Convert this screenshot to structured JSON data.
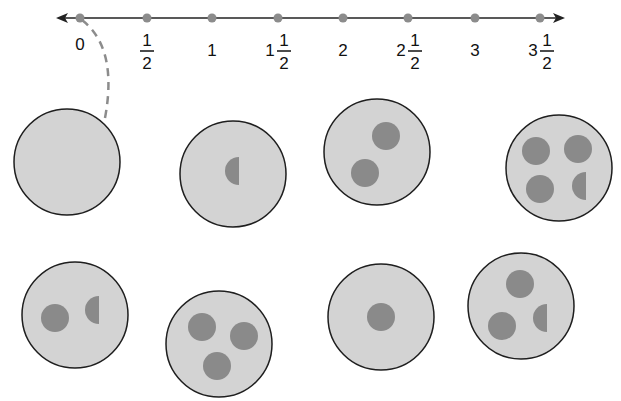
{
  "number_line": {
    "labels": [
      {
        "whole": "0",
        "num": "",
        "den": ""
      },
      {
        "whole": "",
        "num": "1",
        "den": "2"
      },
      {
        "whole": "1",
        "num": "",
        "den": ""
      },
      {
        "whole": "1",
        "num": "1",
        "den": "2"
      },
      {
        "whole": "2",
        "num": "",
        "den": ""
      },
      {
        "whole": "2",
        "num": "1",
        "den": "2"
      },
      {
        "whole": "3",
        "num": "",
        "den": ""
      },
      {
        "whole": "3",
        "num": "1",
        "den": "2"
      }
    ],
    "values": [
      0,
      0.5,
      1,
      1.5,
      2,
      2.5,
      3,
      3.5
    ]
  },
  "circles": [
    {
      "id": "circle-1",
      "row": 1,
      "whole_dots": 0,
      "half_dots": 0,
      "value": 0
    },
    {
      "id": "circle-2",
      "row": 1,
      "whole_dots": 0,
      "half_dots": 1,
      "value": 0.5
    },
    {
      "id": "circle-3",
      "row": 1,
      "whole_dots": 2,
      "half_dots": 0,
      "value": 2
    },
    {
      "id": "circle-4",
      "row": 1,
      "whole_dots": 3,
      "half_dots": 1,
      "value": 3.5
    },
    {
      "id": "circle-5",
      "row": 2,
      "whole_dots": 1,
      "half_dots": 1,
      "value": 1.5
    },
    {
      "id": "circle-6",
      "row": 2,
      "whole_dots": 3,
      "half_dots": 0,
      "value": 3
    },
    {
      "id": "circle-7",
      "row": 2,
      "whole_dots": 1,
      "half_dots": 0,
      "value": 1
    },
    {
      "id": "circle-8",
      "row": 2,
      "whole_dots": 2,
      "half_dots": 1,
      "value": 2.5
    }
  ],
  "connector": {
    "from_value": 0,
    "to_circle": "circle-1",
    "style": "dashed"
  },
  "colors": {
    "line": "#222222",
    "tick_point": "#8c8c8c",
    "circle_fill": "#d3d3d3",
    "circle_stroke": "#1e1e1e",
    "dot_fill": "#8a8a8a",
    "dashed": "#8c8c8c"
  }
}
